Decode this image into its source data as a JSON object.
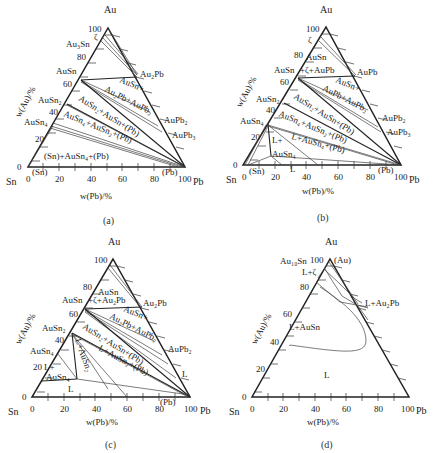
{
  "figure": {
    "panels": [
      {
        "caption": "(a)",
        "vertices": {
          "top": "Au",
          "left": "Sn",
          "right": "Pb"
        },
        "left_axis_label": "w(Au)/%",
        "bottom_axis_label": "w(Pb)/%",
        "left_ticks": [
          "100",
          "80",
          "60",
          "40",
          "20",
          "0"
        ],
        "bottom_ticks": [
          "0",
          "20",
          "40",
          "60",
          "80",
          "100"
        ],
        "phase_labels": {
          "au3sn": "Au₃Sn",
          "zeta": "ζ",
          "ausn": "AuSn",
          "ausn2": "AuSn₂",
          "ausn4": "AuSn₄",
          "au2pb": "Au₂Pb",
          "aupb2": "AuPb₂",
          "aupb3": "AuPb₃",
          "r1": "AuSn+",
          "r2": "Au₂Pb+AuPb₂",
          "r3": "AuSn₂+AuSn+(Pb)",
          "r4": "AuSn₄+AuSn₂+(Pb)",
          "r5": "(Sn)+AuSn₄+(Pb)",
          "sn_ss": "(Sn)",
          "pb_ss": "(Pb)"
        }
      },
      {
        "caption": "(b)",
        "vertices": {
          "top": "Au",
          "left": "Sn",
          "right": "Pb"
        },
        "left_axis_label": "w(Au)/%",
        "bottom_axis_label": "w(Pb)/%",
        "left_ticks": [
          "100",
          "80",
          "60",
          "40",
          "20",
          "0"
        ],
        "bottom_ticks": [
          "0",
          "20",
          "40",
          "60",
          "80",
          "100"
        ],
        "phase_labels": {
          "zeta": "ζ",
          "ausn_top": "AuSn",
          "ausn": "AuSn",
          "r0": "+ζ+AuPb",
          "aupb": "AuPb",
          "ausn2": "AuSn₂",
          "ausn4": "AuSn₄",
          "aupb2": "AuPb₂",
          "aupb3": "AuPb₃",
          "r1": "AuSn+",
          "r2": "AuPb+AuPb₂",
          "r3": "AuSn₂+AuSn+(Pb)",
          "r4": "AuSn₄+AuSn₂+(Pb)",
          "r5": "L+AuSn₄+(Pb)",
          "l_plus": "L+",
          "l_ausn4": "AuSn₄",
          "l": "L",
          "sn_ss": "(Sn)",
          "pb_ss": "(Pb)"
        }
      },
      {
        "caption": "(c)",
        "vertices": {
          "top": "Au",
          "left": "Sn",
          "right": "Pb"
        },
        "left_axis_label": "w(Au)/%",
        "bottom_axis_label": "w(Pb)/%",
        "left_ticks": [
          "100",
          "80",
          "60",
          "40",
          "20",
          "0"
        ],
        "bottom_ticks": [
          "0",
          "20",
          "40",
          "60",
          "80",
          "100"
        ],
        "phase_labels": {
          "ausn_top": "AuSn",
          "ausn": "AuSn",
          "r0": "+ζ+Au₂Pb",
          "au2pb": "Au₂Pb",
          "ausn2": "AuSn₂",
          "ausn4": "AuSn₄",
          "aupb2": "AuPb₂",
          "r1": "AuSn+",
          "r2": "Au₂Pb+AuPb₂",
          "r3": "AuSn₂+AuSn+(Pb)",
          "r4": "L+AuSn₂+(Pb)",
          "r5": "L+AuSn₂",
          "l_plus": "L+",
          "l_ausn4": "AuSn₄",
          "l": "L",
          "l_right": "L",
          "pb_ss": "(Pb)"
        }
      },
      {
        "caption": "(d)",
        "vertices": {
          "top": "Au",
          "left": "Sn",
          "right": "Pb"
        },
        "left_axis_label": "w(Au)/%",
        "bottom_axis_label": "w(Pb)/%",
        "left_ticks": [
          "100",
          "80",
          "60",
          "40",
          "20",
          "0"
        ],
        "bottom_ticks": [
          "0",
          "20",
          "40",
          "60",
          "80",
          "100"
        ],
        "phase_labels": {
          "au10sn": "Au₁₀Sn",
          "au_ss": "(Au)",
          "l_zeta": "L+ζ",
          "l_au2pb": "L+Au₂Pb",
          "l_ausn": "L+AuSn",
          "l": "L"
        }
      }
    ]
  }
}
